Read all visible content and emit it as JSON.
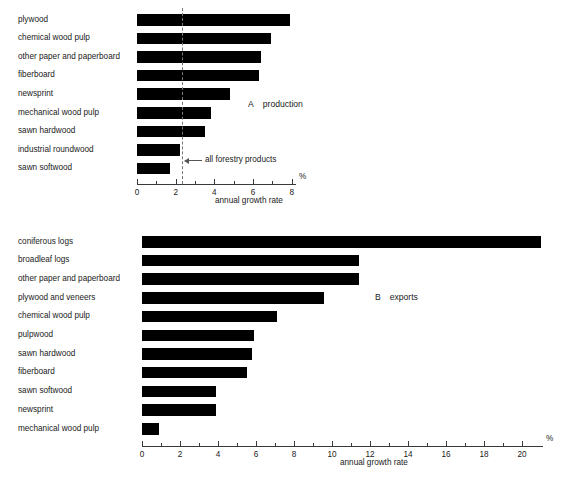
{
  "figure": {
    "axis_title": "annual growth rate",
    "percent_symbol": "%"
  },
  "chart_data": [
    {
      "id": "A",
      "type": "bar",
      "orientation": "horizontal",
      "title": "production",
      "panel_letter": "A",
      "xlabel": "annual growth rate",
      "ylabel": "",
      "unit": "%",
      "xlim": [
        0,
        8
      ],
      "xticks": [
        0,
        2,
        4,
        6,
        8
      ],
      "xtick_labels": [
        "0",
        "2",
        "4",
        "6",
        "8"
      ],
      "minor_tick_step": 1,
      "grid": false,
      "legend": "none",
      "categories": [
        "plywood",
        "chemical wood pulp",
        "other paper and paperboard",
        "fiberboard",
        "newsprint",
        "mechanical wood pulp",
        "sawn hardwood",
        "industrial roundwood",
        "sawn softwood"
      ],
      "values": [
        7.9,
        6.9,
        6.4,
        6.3,
        4.8,
        3.8,
        3.5,
        2.2,
        1.7
      ],
      "reference_line": {
        "value": 2.3,
        "label": "all forestry products",
        "style": "dashed"
      }
    },
    {
      "id": "B",
      "type": "bar",
      "orientation": "horizontal",
      "title": "exports",
      "panel_letter": "B",
      "xlabel": "annual growth rate",
      "ylabel": "",
      "unit": "%",
      "xlim": [
        0,
        21
      ],
      "xticks": [
        0,
        2,
        4,
        6,
        8,
        10,
        12,
        14,
        16,
        18,
        20
      ],
      "xtick_labels": [
        "0",
        "2",
        "4",
        "6",
        "8",
        "10",
        "12",
        "14",
        "16",
        "18",
        "20"
      ],
      "minor_tick_step": 1,
      "grid": false,
      "legend": "none",
      "categories": [
        "coniferous logs",
        "broadleaf logs",
        "other paper and paperboard",
        "plywood and veneers",
        "chemical wood pulp",
        "pulpwood",
        "sawn hardwood",
        "fiberboard",
        "sawn softwood",
        "newsprint",
        "mechanical wood pulp"
      ],
      "values": [
        21.0,
        11.4,
        11.4,
        9.6,
        7.1,
        5.9,
        5.8,
        5.5,
        3.9,
        3.9,
        0.9
      ],
      "reference_line": null
    }
  ]
}
